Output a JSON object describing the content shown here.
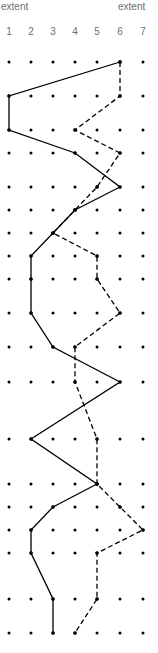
{
  "chart_data": {
    "type": "line",
    "title": "",
    "header_left": "extent",
    "header_right": "extent",
    "columns": [
      "1",
      "2",
      "3",
      "4",
      "5",
      "6",
      "7"
    ],
    "row_count": 19,
    "grid": "dot-grid",
    "series": [
      {
        "name": "solid",
        "style": "solid",
        "color": "#000000",
        "values": [
          6,
          1,
          1,
          4,
          6,
          4,
          3,
          2,
          2,
          2,
          3,
          6,
          2,
          5,
          3,
          2,
          2,
          3,
          3
        ]
      },
      {
        "name": "dashed",
        "style": "dashed",
        "color": "#000000",
        "values": [
          6,
          6,
          4,
          6,
          5,
          4,
          3,
          5,
          5,
          6,
          4,
          4,
          5,
          5,
          6,
          7,
          5,
          5,
          4
        ]
      }
    ],
    "label_color": "#6e6e6e"
  }
}
